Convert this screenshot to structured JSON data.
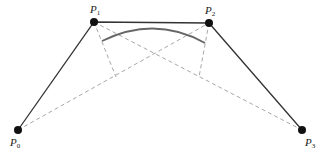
{
  "diagram": {
    "type": "bezier-construction",
    "points": [
      {
        "id": "P0",
        "label": "P",
        "sub": "0",
        "x": 18,
        "y": 130,
        "lx": 10,
        "ly": 146
      },
      {
        "id": "P1",
        "label": "P",
        "sub": "1",
        "x": 94,
        "y": 22,
        "lx": 90,
        "ly": 13
      },
      {
        "id": "P2",
        "label": "P",
        "sub": "2",
        "x": 209,
        "y": 23,
        "lx": 205,
        "ly": 14
      },
      {
        "id": "P3",
        "label": "P",
        "sub": "3",
        "x": 302,
        "y": 130,
        "lx": 305,
        "ly": 146
      }
    ],
    "colors": {
      "control_polygon": "#333333",
      "dashed": "#a8a8a8",
      "curve": "#666666",
      "point": "#111111"
    }
  }
}
